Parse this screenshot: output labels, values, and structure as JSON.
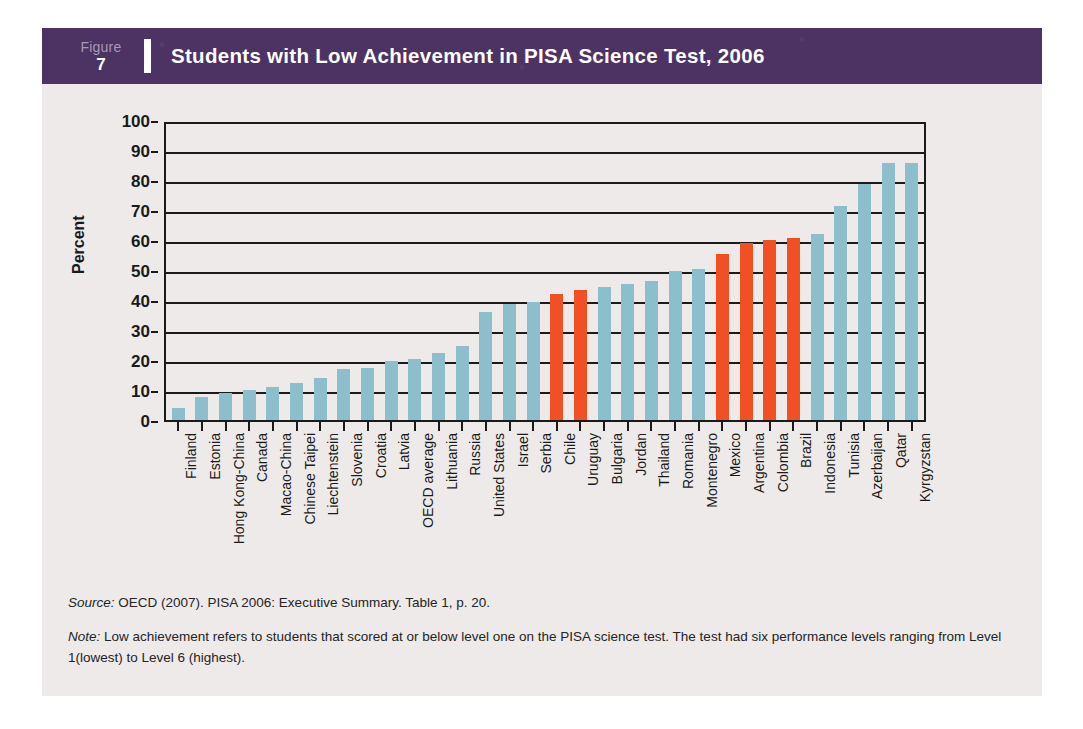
{
  "header": {
    "figure_word": "Figure",
    "figure_number": "7",
    "title": "Students with Low Achievement in PISA Science Test, 2006",
    "band_color": "#4c3363",
    "divider_color": "#ffffff"
  },
  "footnotes": {
    "source_label": "Source:",
    "source_text": " OECD (2007). PISA 2006: Executive Summary. Table 1, p. 20.",
    "note_label": "Note:",
    "note_text": " Low achievement refers to students that scored at or below level one on the PISA science test. The test had six performance levels ranging from Level 1(lowest) to Level 6 (highest)."
  },
  "colors": {
    "bar_default": "#8cbecb",
    "bar_highlight": "#f14f24",
    "card_background": "#eeeaea",
    "axis": "#1a1a1a"
  },
  "chart_data": {
    "type": "bar",
    "title": "Students with Low Achievement in PISA Science Test, 2006",
    "xlabel": "",
    "ylabel": "Percent",
    "ylim": [
      0,
      100
    ],
    "yticks": [
      0,
      10,
      20,
      30,
      40,
      50,
      60,
      70,
      80,
      90,
      100
    ],
    "grid": true,
    "legend": null,
    "highlight_color": "#f14f24",
    "default_color": "#8cbecb",
    "highlight_note": "Latin American countries shown in orange",
    "categories": [
      "Finland",
      "Estonia",
      "Hong Kong-China",
      "Canada",
      "Macao-China",
      "Chinese Taipei",
      "Liechtenstein",
      "Slovenia",
      "Croatia",
      "Latvia",
      "OECD average",
      "Lithuania",
      "Russia",
      "United States",
      "Israel",
      "Serbia",
      "Chile",
      "Uruguay",
      "Bulgaria",
      "Jordan",
      "Thailand",
      "Romania",
      "Montenegro",
      "Mexico",
      "Argentina",
      "Colombia",
      "Brazil",
      "Indonesia",
      "Tunisia",
      "Azerbaijan",
      "Qatar",
      "Kyrgyzstan"
    ],
    "values": [
      4,
      7.5,
      9,
      10,
      11,
      12.5,
      14,
      17,
      17.5,
      20,
      20.5,
      22.5,
      25,
      36.5,
      39,
      40,
      42.5,
      44,
      45,
      46,
      47,
      50.5,
      51,
      56,
      60,
      61,
      61.5,
      63,
      72.5,
      80,
      87,
      87
    ],
    "highlighted": [
      false,
      false,
      false,
      false,
      false,
      false,
      false,
      false,
      false,
      false,
      false,
      false,
      false,
      false,
      false,
      false,
      true,
      true,
      false,
      false,
      false,
      false,
      false,
      true,
      true,
      true,
      true,
      false,
      false,
      false,
      false,
      false
    ]
  }
}
